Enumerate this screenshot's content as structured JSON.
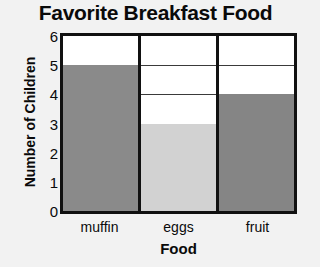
{
  "chart_data": {
    "type": "bar",
    "title": "Favorite Breakfast Food",
    "xlabel": "Food",
    "ylabel": "Number of Children",
    "categories": [
      "muffin",
      "eggs",
      "fruit"
    ],
    "values": [
      5,
      3,
      4
    ],
    "ylim": [
      0,
      6
    ],
    "ytick_labels": [
      "0",
      "1",
      "2",
      "3",
      "4",
      "5",
      "6"
    ],
    "ytick_values": [
      0,
      1,
      2,
      3,
      4,
      5,
      6
    ],
    "grid": true,
    "legend": false,
    "bar_colors": [
      "#8a8a8a",
      "#d2d2d2",
      "#858585"
    ],
    "plot_background": "#ffffff",
    "axis_color": "#111111",
    "gridline_color": "#3a3a3a",
    "page_background": "#f2f2f2",
    "text_color": "#0a0a0a"
  }
}
